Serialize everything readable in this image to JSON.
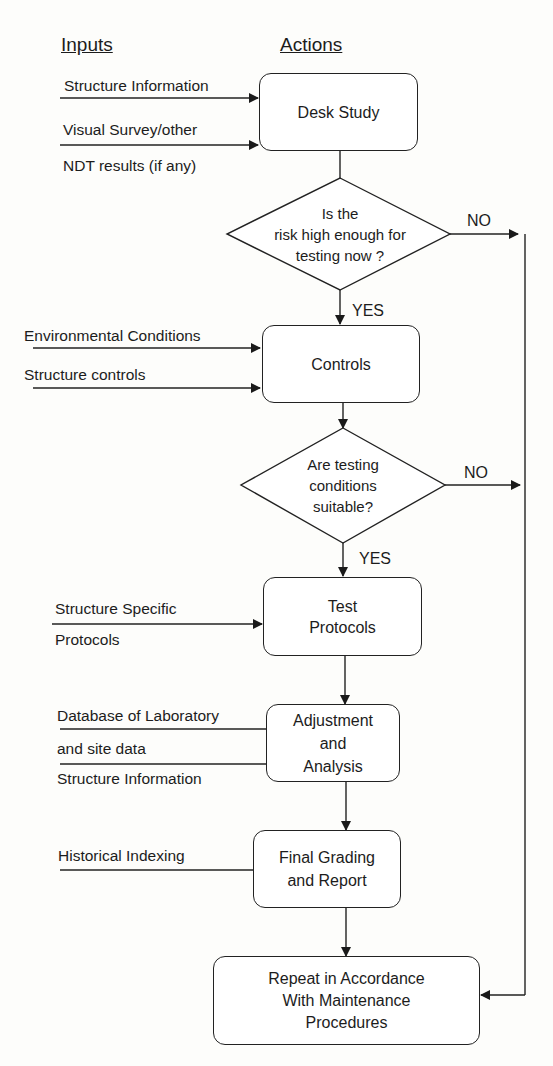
{
  "headers": {
    "inputs": "Inputs",
    "actions": "Actions"
  },
  "inputs": {
    "desk_study": [
      "Structure Information",
      "Visual Survey/other",
      "NDT results (if any)"
    ],
    "controls": [
      "Environmental Conditions",
      "Structure controls"
    ],
    "test_protocols": [
      "Structure Specific",
      "Protocols"
    ],
    "adjustment": [
      "Database of Laboratory",
      "and site data",
      "Structure Information"
    ],
    "final_grading": [
      "Historical Indexing"
    ]
  },
  "actions": {
    "desk_study": "Desk Study",
    "controls": "Controls",
    "test_protocols": [
      "Test",
      "Protocols"
    ],
    "adjustment": [
      "Adjustment",
      "and",
      "Analysis"
    ],
    "final_grading": [
      "Final Grading",
      "and Report"
    ],
    "repeat": [
      "Repeat in Accordance",
      "With Maintenance",
      "Procedures"
    ]
  },
  "decisions": {
    "risk": [
      "Is the",
      "risk high enough for",
      "testing now ?"
    ],
    "conditions": [
      "Are testing",
      "conditions",
      "suitable?"
    ]
  },
  "labels": {
    "yes": "YES",
    "no": "NO"
  }
}
